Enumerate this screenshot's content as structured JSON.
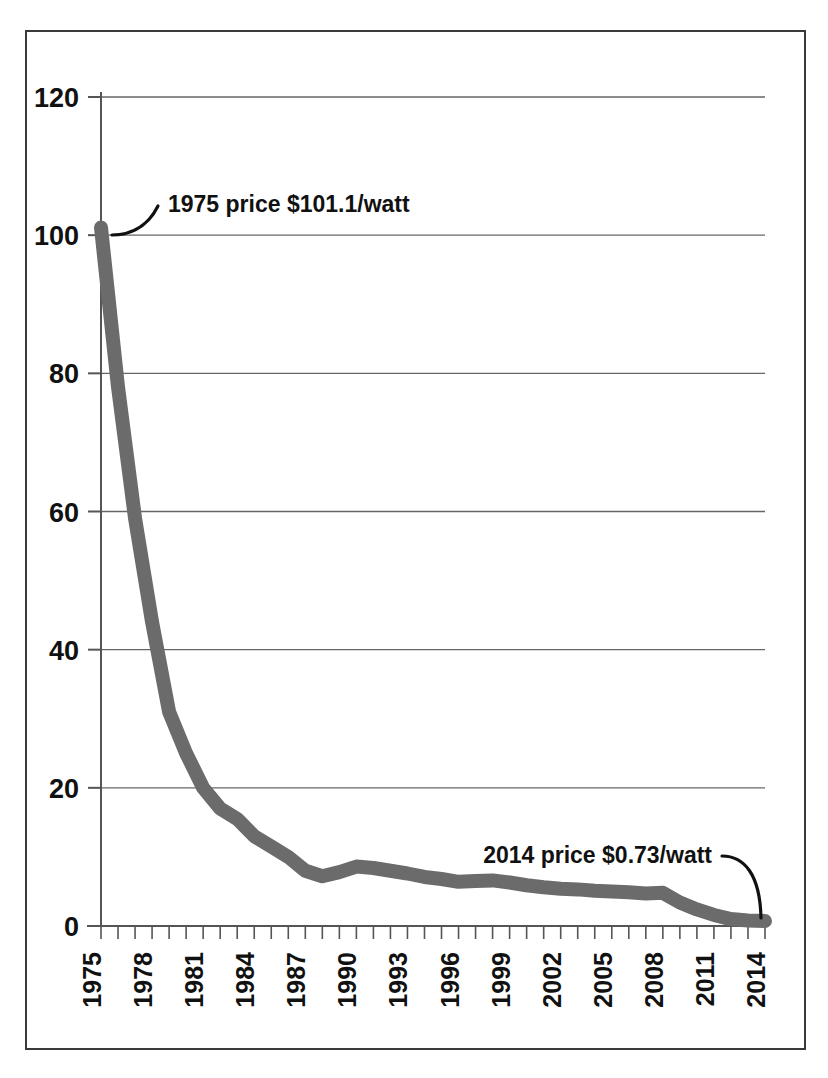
{
  "figure": {
    "border_color": "#3a3a3a",
    "background": "#ffffff",
    "series_color": "#6b6b6b",
    "axis_color": "#555555",
    "gridline_color": "#666666",
    "text_color": "#111111"
  },
  "annotations": {
    "start": "1975 price $101.1/watt",
    "end": "2014 price $0.73/watt"
  },
  "chart_data": {
    "type": "line",
    "title": "",
    "xlabel": "",
    "ylabel": "",
    "xlim": [
      1975,
      2014
    ],
    "ylim": [
      0,
      120
    ],
    "grid": true,
    "legend": "none",
    "y_ticks": [
      0,
      20,
      40,
      60,
      80,
      100,
      120
    ],
    "x_tick_labels": [
      "1975",
      "1978",
      "1981",
      "1984",
      "1987",
      "1990",
      "1993",
      "1996",
      "1999",
      "2002",
      "2005",
      "2008",
      "2011",
      "2014"
    ],
    "x_minor_tick_interval": 1,
    "x": [
      1975,
      1976,
      1977,
      1978,
      1979,
      1980,
      1981,
      1982,
      1983,
      1984,
      1985,
      1986,
      1987,
      1988,
      1989,
      1990,
      1991,
      1992,
      1993,
      1994,
      1995,
      1996,
      1997,
      1998,
      1999,
      2000,
      2001,
      2002,
      2003,
      2004,
      2005,
      2006,
      2007,
      2008,
      2009,
      2010,
      2011,
      2012,
      2013,
      2014
    ],
    "values": [
      101.1,
      78.0,
      59.0,
      44.0,
      31.0,
      25.0,
      20.0,
      17.0,
      15.5,
      13.0,
      11.5,
      10.0,
      8.0,
      7.2,
      7.8,
      8.6,
      8.4,
      8.0,
      7.6,
      7.1,
      6.8,
      6.4,
      6.5,
      6.6,
      6.3,
      5.9,
      5.6,
      5.4,
      5.3,
      5.1,
      5.0,
      4.9,
      4.7,
      4.8,
      3.4,
      2.4,
      1.6,
      1.0,
      0.8,
      0.73
    ],
    "series": [
      {
        "name": "PV module price (USD per watt)",
        "values": [
          101.1,
          78.0,
          59.0,
          44.0,
          31.0,
          25.0,
          20.0,
          17.0,
          15.5,
          13.0,
          11.5,
          10.0,
          8.0,
          7.2,
          7.8,
          8.6,
          8.4,
          8.0,
          7.6,
          7.1,
          6.8,
          6.4,
          6.5,
          6.6,
          6.3,
          5.9,
          5.6,
          5.4,
          5.3,
          5.1,
          5.0,
          4.9,
          4.7,
          4.8,
          3.4,
          2.4,
          1.6,
          1.0,
          0.8,
          0.73
        ]
      }
    ]
  }
}
